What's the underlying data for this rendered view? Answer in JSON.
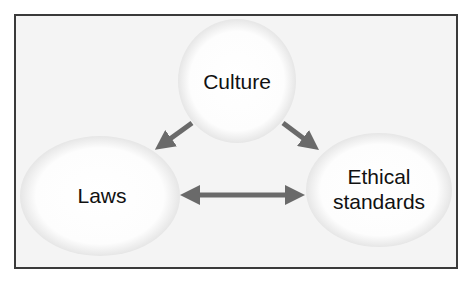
{
  "diagram": {
    "nodes": [
      {
        "id": "culture",
        "label": "Culture"
      },
      {
        "id": "laws",
        "label": "Laws"
      },
      {
        "id": "ethical",
        "label_line1": "Ethical",
        "label_line2": "standards"
      }
    ],
    "edges": [
      {
        "from": "Culture",
        "to": "Laws",
        "type": "directed"
      },
      {
        "from": "Culture",
        "to": "Ethical standards",
        "type": "directed"
      },
      {
        "from": "Laws",
        "to": "Ethical standards",
        "type": "bidirectional"
      }
    ],
    "colors": {
      "border": "#3a3a3a",
      "background": "#f4f4f4",
      "arrow": "#6a6a6a",
      "node_fill": "#ffffff"
    }
  }
}
